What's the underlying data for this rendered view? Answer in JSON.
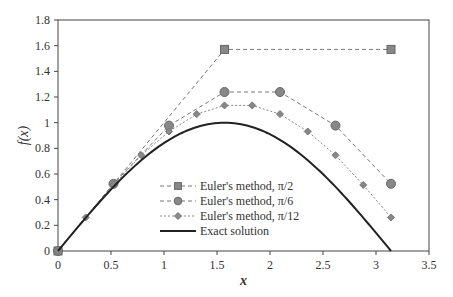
{
  "chart_data": {
    "type": "line",
    "title": "",
    "xlabel": "x",
    "ylabel": "f(x)",
    "xlim": [
      0,
      3.5
    ],
    "ylim": [
      0,
      1.8
    ],
    "xticks": [
      "0",
      "0.5",
      "1",
      "1.5",
      "2",
      "2.5",
      "3",
      "3.5"
    ],
    "yticks": [
      "0",
      "0.2",
      "0.4",
      "0.6",
      "0.8",
      "1",
      "1.2",
      "1.4",
      "1.6",
      "1.8"
    ],
    "grid": false,
    "legend_position": "lower-center-left",
    "series": [
      {
        "name": "Euler's method, π/2",
        "marker": "square",
        "style": "dashed",
        "x": [
          0,
          1.5708,
          3.1416
        ],
        "y": [
          0,
          1.5708,
          1.5708
        ]
      },
      {
        "name": "Euler's method, π/6",
        "marker": "circle",
        "style": "dashed",
        "x": [
          0,
          0.5236,
          1.0472,
          1.5708,
          2.0944,
          2.618,
          3.1416
        ],
        "y": [
          0,
          0.5236,
          0.977,
          1.2388,
          1.2388,
          0.977,
          0.5236
        ]
      },
      {
        "name": "Euler's method, π/12",
        "marker": "diamond",
        "style": "dotted",
        "x": [
          0,
          0.2618,
          0.5236,
          0.7854,
          1.0472,
          1.309,
          1.5708,
          1.8326,
          2.0944,
          2.3562,
          2.618,
          2.8798,
          3.1416
        ],
        "y": [
          0,
          0.2618,
          0.5147,
          0.7462,
          0.9313,
          1.0668,
          1.1345,
          1.1345,
          1.0668,
          0.9313,
          0.7462,
          0.5147,
          0.2618
        ]
      },
      {
        "name": "Exact solution",
        "marker": "none",
        "style": "solid",
        "function": "sin(x)",
        "x": [
          0,
          0.5,
          1,
          1.5708,
          2,
          2.5,
          3,
          3.1416
        ],
        "y": [
          0,
          0.479,
          0.841,
          1,
          0.909,
          0.598,
          0.141,
          0
        ]
      }
    ]
  }
}
